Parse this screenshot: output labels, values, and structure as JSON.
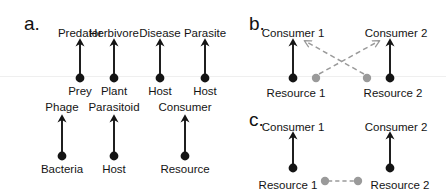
{
  "figure": {
    "background_color": "#ffffff",
    "ink_color": "#141414",
    "accent_gray": "#9a9a9a",
    "artifact_line_color": "#efefef"
  },
  "panels": [
    {
      "id": "a",
      "letter": "a.",
      "letter_x": 24,
      "letter_y": 14,
      "description": "Pairwise consumer-resource motifs",
      "pairs": [
        {
          "name": "predator-prey",
          "top_label": "Predator",
          "bottom_label": "Prey",
          "x": 80,
          "top_label_y": 28,
          "bottom_label_y": 86,
          "arrow_tip_y": 38,
          "dot_y": 78
        },
        {
          "name": "herbivore-plant",
          "top_label": "Herbivore",
          "bottom_label": "Plant",
          "x": 114,
          "top_label_y": 28,
          "bottom_label_y": 86,
          "arrow_tip_y": 38,
          "dot_y": 78
        },
        {
          "name": "disease-host",
          "top_label": "Disease",
          "bottom_label": "Host",
          "x": 160,
          "top_label_y": 28,
          "bottom_label_y": 86,
          "arrow_tip_y": 38,
          "dot_y": 78
        },
        {
          "name": "parasite-host",
          "top_label": "Parasite",
          "bottom_label": "Host",
          "x": 205,
          "top_label_y": 28,
          "bottom_label_y": 86,
          "arrow_tip_y": 38,
          "dot_y": 78
        },
        {
          "name": "phage-bacteria",
          "top_label": "Phage",
          "bottom_label": "Bacteria",
          "x": 62,
          "top_label_y": 102,
          "bottom_label_y": 164,
          "arrow_tip_y": 114,
          "dot_y": 156
        },
        {
          "name": "parasitoid-host",
          "top_label": "Parasitoid",
          "bottom_label": "Host",
          "x": 114,
          "top_label_y": 102,
          "bottom_label_y": 164,
          "arrow_tip_y": 114,
          "dot_y": 156
        },
        {
          "name": "consumer-resource",
          "top_label": "Consumer",
          "bottom_label": "Resource",
          "x": 185,
          "top_label_y": 102,
          "bottom_label_y": 164,
          "arrow_tip_y": 114,
          "dot_y": 156
        }
      ]
    },
    {
      "id": "b",
      "letter": "b.",
      "letter_x": 249,
      "letter_y": 14,
      "description": "Apparent competition: consumers share resources via crossed indirect links",
      "consumers": [
        {
          "label": "Consumer 1",
          "x": 293,
          "label_y": 28
        },
        {
          "label": "Consumer 2",
          "x": 396,
          "label_y": 28
        }
      ],
      "resources": [
        {
          "label": "Resource 1",
          "x": 296,
          "label_y": 88,
          "dot_x": 293,
          "dot_y": 78
        },
        {
          "label": "Resource 2",
          "x": 393,
          "label_y": 88,
          "dot_x": 390,
          "dot_y": 78
        }
      ],
      "direct_arrows": [
        {
          "name": "resource-1-to-consumer-1",
          "x": 293,
          "from_y": 78,
          "to_y": 38
        },
        {
          "name": "resource-2-to-consumer-2",
          "x": 390,
          "from_y": 78,
          "to_y": 38
        }
      ],
      "gray_nodes": [
        {
          "name": "gray-node-left",
          "x": 316,
          "y": 78
        },
        {
          "name": "gray-node-right",
          "x": 367,
          "y": 78
        }
      ],
      "indirect_arrows": [
        {
          "name": "gray-dashed-left-to-consumer-2",
          "x1": 316,
          "y1": 74,
          "x2": 380,
          "y2": 40
        },
        {
          "name": "gray-dashed-right-to-consumer-1",
          "x1": 367,
          "y1": 74,
          "x2": 305,
          "y2": 40
        }
      ]
    },
    {
      "id": "c",
      "letter": "c.",
      "letter_x": 249,
      "letter_y": 110,
      "description": "Resource competition: resources linked by a horizontal indirect interaction",
      "consumers": [
        {
          "label": "Consumer 1",
          "x": 293,
          "label_y": 122
        },
        {
          "label": "Consumer 2",
          "x": 396,
          "label_y": 122
        }
      ],
      "resources": [
        {
          "label": "Resource 1",
          "x": 288,
          "label_y": 180,
          "dot_x": 293,
          "dot_y": 168
        },
        {
          "label": "Resource 2",
          "x": 400,
          "label_y": 180,
          "dot_x": 390,
          "dot_y": 168
        }
      ],
      "direct_arrows": [
        {
          "name": "resource-1-to-consumer-1",
          "x": 293,
          "from_y": 168,
          "to_y": 132
        },
        {
          "name": "resource-2-to-consumer-2",
          "x": 390,
          "from_y": 168,
          "to_y": 132
        }
      ],
      "gray_nodes": [
        {
          "name": "gray-node-left",
          "x": 325,
          "y": 181
        },
        {
          "name": "gray-node-right",
          "x": 358,
          "y": 181
        }
      ],
      "indirect_links": [
        {
          "name": "gray-dashed-resource-link",
          "x1": 328,
          "y1": 181,
          "x2": 355,
          "y2": 181
        }
      ]
    }
  ],
  "artifact_lines": [
    {
      "name": "scan-artifact-line",
      "y": 76
    }
  ]
}
